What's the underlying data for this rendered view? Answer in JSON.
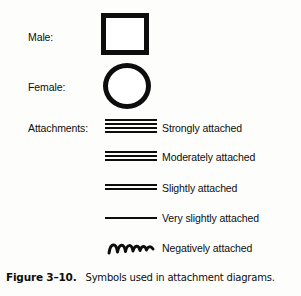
{
  "figure": {
    "caption_label": "Figure 3–10.",
    "caption_text": "Symbols used in attachment diagrams.",
    "ink_color": "#0d0d0d",
    "background_color": "#fdfdfc"
  },
  "rows": [
    {
      "label": "Male:",
      "symbol": "square",
      "description": ""
    },
    {
      "label": "Female:",
      "symbol": "circle",
      "description": ""
    },
    {
      "label": "Attachments:",
      "symbol": "four-lines",
      "line_count": 4,
      "description": "Strongly attached"
    },
    {
      "label": "",
      "symbol": "three-lines",
      "line_count": 3,
      "description": "Moderately attached"
    },
    {
      "label": "",
      "symbol": "two-lines",
      "line_count": 2,
      "description": "Slightly attached"
    },
    {
      "label": "",
      "symbol": "one-line",
      "line_count": 1,
      "description": "Very slightly attached"
    },
    {
      "label": "",
      "symbol": "wavy-line",
      "line_count": 0,
      "description": "Negatively attached"
    }
  ]
}
